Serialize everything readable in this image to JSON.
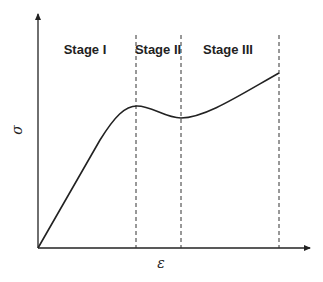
{
  "diagram": {
    "axes": {
      "x_label": "ε",
      "y_label": "σ"
    },
    "stages": [
      {
        "label": "Stage I"
      },
      {
        "label": "Stage II"
      },
      {
        "label": "Stage III"
      }
    ],
    "colors": {
      "line": "#222222",
      "dashed": "#333333",
      "background": "#ffffff"
    }
  }
}
